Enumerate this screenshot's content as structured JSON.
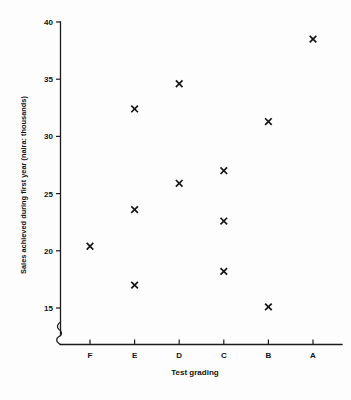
{
  "chart_data": {
    "type": "scatter",
    "title": "",
    "xlabel": "Test grading",
    "ylabel": "Sales achieved during first year (naira: thousands)",
    "categories": [
      "F",
      "E",
      "D",
      "C",
      "B",
      "A"
    ],
    "yticks": [
      15,
      20,
      25,
      30,
      35,
      40
    ],
    "ylim": [
      13.8,
      40
    ],
    "y_axis_break": true,
    "grid": false,
    "legend": null,
    "marker": "x",
    "marker_color": "#161616",
    "points": [
      {
        "x": "F",
        "y": 20.4
      },
      {
        "x": "E",
        "y": 32.4
      },
      {
        "x": "E",
        "y": 23.6
      },
      {
        "x": "E",
        "y": 17.0
      },
      {
        "x": "D",
        "y": 34.6
      },
      {
        "x": "D",
        "y": 25.9
      },
      {
        "x": "C",
        "y": 27.0
      },
      {
        "x": "C",
        "y": 22.6
      },
      {
        "x": "C",
        "y": 18.2
      },
      {
        "x": "B",
        "y": 31.3
      },
      {
        "x": "B",
        "y": 15.1
      },
      {
        "x": "A",
        "y": 38.5
      }
    ]
  },
  "axes": {
    "x_tick_labels": [
      "F",
      "E",
      "D",
      "C",
      "B",
      "A"
    ],
    "y_tick_labels": [
      "15",
      "20",
      "25",
      "30",
      "35",
      "40"
    ],
    "x_axis_title": "Test grading",
    "y_axis_title": "Sales achieved during first year (naira: thousands)"
  }
}
